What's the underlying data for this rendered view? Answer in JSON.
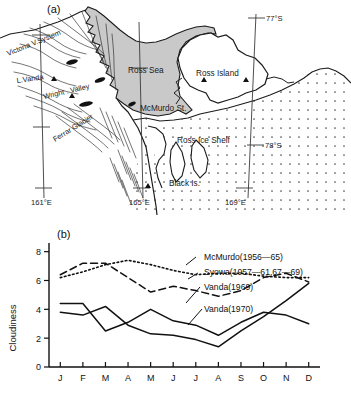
{
  "figure": {
    "panel_a": {
      "label": "(a)",
      "type": "map",
      "region": "Ross Sea / McMurdo Sound, Antarctica",
      "sea_fill_color": "#c9c9c9",
      "ice_shelf_stipple_color": "#555555",
      "outline_color": "#111111",
      "place_labels": [
        {
          "name": "victoria-valley-system",
          "text": "Victona V.System",
          "x": 8,
          "y": 56,
          "rotate": -22
        },
        {
          "name": "lake-vanda",
          "text": "L.Vanda",
          "x": 17,
          "y": 83,
          "rotate": -8
        },
        {
          "name": "wright-valley",
          "text": "Wright . Valley",
          "x": 44,
          "y": 97,
          "rotate": -13
        },
        {
          "name": "ferrar-glacier",
          "text": "Ferrar  Glacier",
          "x": 55,
          "y": 140,
          "rotate": -30
        },
        {
          "name": "ross-sea",
          "text": "Ross   Sea",
          "x": 128,
          "y": 70,
          "rotate": 0
        },
        {
          "name": "ross-island",
          "text": "Ross  Island",
          "x": 196,
          "y": 73,
          "rotate": 0
        },
        {
          "name": "mcmurdo-station",
          "text": "McMurdo St.",
          "x": 140,
          "y": 108,
          "rotate": 0
        },
        {
          "name": "ross-ice-shelf",
          "text": "Ross  Ice  Shelf",
          "x": 177,
          "y": 140,
          "rotate": 0
        },
        {
          "name": "black-island",
          "text": "Black Is.",
          "x": 169,
          "y": 183,
          "rotate": 0
        }
      ],
      "graticule_labels": [
        {
          "name": "lat-77-south",
          "text": "77°S",
          "x": 263,
          "y": 21
        },
        {
          "name": "lat-78-south",
          "text": "78°S",
          "x": 262,
          "y": 149
        },
        {
          "name": "lon-161-east",
          "text": "161°E",
          "x": 36,
          "y": 207
        },
        {
          "name": "lon-165-east",
          "text": "165°E",
          "x": 133,
          "y": 207
        },
        {
          "name": "lon-169-east",
          "text": "169°E",
          "x": 229,
          "y": 207
        }
      ],
      "station_markers": [
        {
          "name": "marker-vanda",
          "x": 54,
          "y": 79
        },
        {
          "name": "marker-wright-valley",
          "x": 72,
          "y": 96
        },
        {
          "name": "marker-ross-island-west",
          "x": 204,
          "y": 80
        },
        {
          "name": "marker-ross-island-east",
          "x": 246,
          "y": 80
        },
        {
          "name": "marker-south-land",
          "x": 148,
          "y": 186
        }
      ]
    },
    "panel_b": {
      "label": "(b)"
    }
  },
  "chart_data": {
    "type": "line",
    "title": "",
    "xlabel": "",
    "ylabel": "Cloudiness",
    "ylim": [
      0,
      8.6
    ],
    "yticks": [
      0,
      2,
      4,
      6,
      8
    ],
    "ytick_labels": [
      "0",
      "2",
      "4",
      "6",
      "8"
    ],
    "categories": [
      "J",
      "F",
      "M",
      "A",
      "M",
      "J",
      "J",
      "A",
      "S",
      "O",
      "N",
      "D"
    ],
    "grid": false,
    "legend_position": "right-inline",
    "series": [
      {
        "name": "McMurdo(1956—65)",
        "style": "dotted",
        "values": [
          6.2,
          6.6,
          7.1,
          7.4,
          7.1,
          6.7,
          6.4,
          6.5,
          6.5,
          6.3,
          6.2,
          6.2
        ]
      },
      {
        "name": "Syowa(1957—61,67—69)",
        "style": "dashed",
        "values": [
          6.4,
          7.2,
          7.2,
          6.2,
          5.2,
          5.6,
          5.3,
          4.9,
          5.3,
          6.2,
          6.5,
          5.9
        ]
      },
      {
        "name": "Vanda(1969)",
        "style": "solid",
        "values": [
          4.4,
          4.4,
          2.5,
          3.1,
          4.0,
          3.2,
          2.9,
          2.2,
          3.1,
          3.8,
          3.6,
          3.0
        ]
      },
      {
        "name": "Vanda(1970)",
        "style": "solid",
        "values": [
          3.8,
          3.6,
          4.2,
          2.9,
          2.3,
          2.2,
          1.9,
          1.4,
          2.5,
          3.5,
          4.6,
          5.8
        ]
      }
    ],
    "legend_entries": [
      {
        "label": "McMurdo(1956—65)",
        "x": 204,
        "y": 47
      },
      {
        "label": "Syowa(1957—61,67—69)",
        "x": 204,
        "y": 62
      },
      {
        "label": "Vanda(1969)",
        "x": 204,
        "y": 77
      },
      {
        "label": "Vanda(1970)",
        "x": 204,
        "y": 99
      }
    ]
  }
}
